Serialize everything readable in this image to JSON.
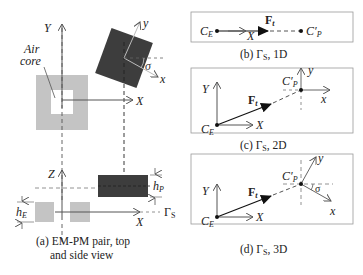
{
  "panel_a": {
    "air_core_label_1": "Air",
    "air_core_label_2": "core",
    "top_axis_Y": "Y",
    "top_axis_X": "X",
    "pm_axis_y": "y",
    "pm_axis_x": "x",
    "angle": "σ",
    "side_axis_Z": "Z",
    "side_axis_X": "X",
    "h_E": "h",
    "h_E_sub": "E",
    "h_P": "h",
    "h_P_sub": "P",
    "gamma": "Γ",
    "gamma_sub": "S",
    "caption_1": "(a) EM-PM pair, top",
    "caption_2": "and side view"
  },
  "panel_b": {
    "C_E": "C",
    "C_E_sub": "E",
    "C_P": "C′",
    "C_P_sub": "P",
    "force": "F",
    "force_sub": "t",
    "axis_X": "X",
    "caption": "(b) Γ",
    "caption_sub": "S",
    "caption_tail": ", 1D"
  },
  "panel_c": {
    "C_E": "C",
    "C_E_sub": "E",
    "C_P": "C′",
    "C_P_sub": "P",
    "force": "F",
    "force_sub": "t",
    "axis_X": "X",
    "axis_Y": "Y",
    "axis_x": "x",
    "axis_y": "y",
    "caption": "(c) Γ",
    "caption_sub": "S",
    "caption_tail": ", 2D"
  },
  "panel_d": {
    "C_E": "C",
    "C_E_sub": "E",
    "C_P": "C′",
    "C_P_sub": "P",
    "force": "F",
    "force_sub": "t",
    "axis_X": "X",
    "axis_Y": "Y",
    "axis_x": "x",
    "axis_y": "y",
    "angle": "σ",
    "caption": "(d) Γ",
    "caption_sub": "S",
    "caption_tail": ", 3D"
  },
  "colors": {
    "em_fill": "#c4c4c4",
    "pm_fill": "#3d3d3d",
    "line": "#555555",
    "dark": "#111111"
  }
}
